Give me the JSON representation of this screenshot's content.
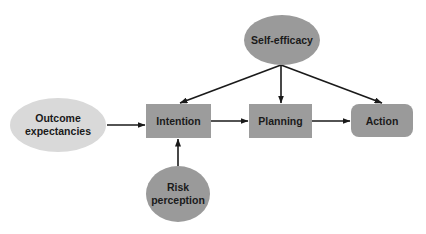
{
  "diagram": {
    "type": "flow",
    "colors": {
      "background": "#ffffff",
      "edge": "#1a1a1a",
      "text": "#1a1a1a",
      "outcome_fill": "#d9d9d9",
      "box_fill": "#9c9c9c",
      "ellipse_fill": "#9a9a9a"
    },
    "nodes": {
      "outcome": {
        "shape": "ellipse",
        "line1": "Outcome",
        "line2": "expectancies"
      },
      "intention": {
        "shape": "rect",
        "label": "Intention"
      },
      "planning": {
        "shape": "rect",
        "label": "Planning"
      },
      "action": {
        "shape": "rounded-rect",
        "label": "Action"
      },
      "self_efficacy": {
        "shape": "ellipse",
        "label": "Self-efficacy"
      },
      "risk": {
        "shape": "ellipse",
        "line1": "Risk",
        "line2": "perception"
      }
    },
    "edges": [
      {
        "from": "Outcome expectancies",
        "to": "Intention"
      },
      {
        "from": "Intention",
        "to": "Planning"
      },
      {
        "from": "Planning",
        "to": "Action"
      },
      {
        "from": "Self-efficacy",
        "to": "Intention"
      },
      {
        "from": "Self-efficacy",
        "to": "Planning"
      },
      {
        "from": "Self-efficacy",
        "to": "Action"
      },
      {
        "from": "Risk perception",
        "to": "Intention"
      }
    ]
  }
}
